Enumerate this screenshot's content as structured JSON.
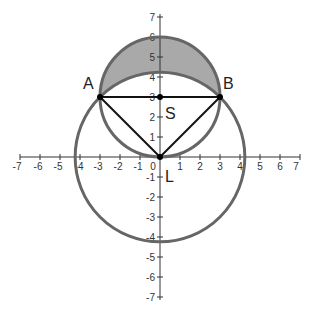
{
  "diagram": {
    "type": "geometry-coordinate-plane",
    "axes": {
      "x_range": [
        -7,
        7
      ],
      "y_range": [
        -7,
        7
      ],
      "x_ticks": [
        "-7",
        "-6",
        "-5",
        "-4",
        "-3",
        "-2",
        "-1",
        "0",
        "1",
        "2",
        "3",
        "4",
        "5",
        "6",
        "7"
      ],
      "y_ticks": [
        "7",
        "6",
        "5",
        "4",
        "3",
        "2",
        "1",
        "-1",
        "-2",
        "-3",
        "-4",
        "-5",
        "-6",
        "-7"
      ]
    },
    "points": {
      "A": {
        "label": "A",
        "x": -3,
        "y": 3
      },
      "B": {
        "label": "B",
        "x": 3,
        "y": 3
      },
      "S": {
        "label": "S",
        "x": 0,
        "y": 3
      },
      "L": {
        "label": "L",
        "x": 0,
        "y": 0
      }
    },
    "circles": [
      {
        "name": "large-circle",
        "center": "L",
        "radius": "3√2 ≈ 4.24"
      },
      {
        "name": "small-circle",
        "center": "S",
        "radius": 3
      }
    ],
    "segments": [
      "AB",
      "AL",
      "BL"
    ],
    "shaded_region": "lune between small circle upper arc and large circle arc above AB",
    "colors": {
      "circle_stroke": "#666666",
      "shade_fill": "#a9a9a9",
      "segment_stroke": "#111111",
      "axis_stroke": "#333333"
    }
  }
}
